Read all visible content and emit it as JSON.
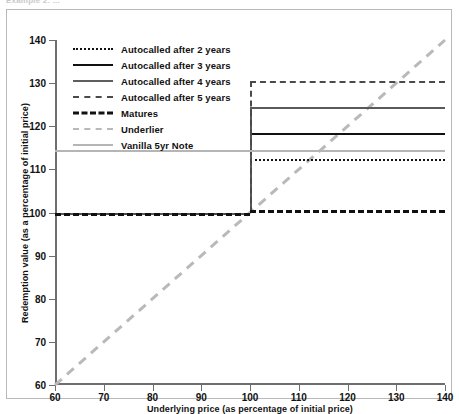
{
  "caption": "Example 2: ...",
  "chart_data": {
    "type": "line",
    "title": "",
    "xlabel": "Underlying price (as percentage of initial price)",
    "ylabel": "Redemption value (as a percentage of initial price)",
    "xlim": [
      60,
      140
    ],
    "ylim": [
      60,
      140
    ],
    "xticks": [
      60,
      70,
      80,
      90,
      100,
      110,
      120,
      130,
      140
    ],
    "yticks": [
      60,
      70,
      80,
      90,
      100,
      110,
      120,
      130,
      140
    ],
    "grid": false,
    "legend_position": "upper-left-inside",
    "step_x": 100,
    "series": [
      {
        "name": "Autocalled after 2 years",
        "style": "dotted",
        "color": "#111111",
        "x": [
          60,
          100,
          100,
          140
        ],
        "y": [
          100,
          100,
          112.5,
          112.5
        ]
      },
      {
        "name": "Autocalled after 3 years",
        "style": "solid",
        "color": "#111111",
        "x": [
          60,
          100,
          100,
          140
        ],
        "y": [
          100,
          100,
          118.5,
          118.5
        ]
      },
      {
        "name": "Autocalled after 4 years",
        "style": "solid",
        "color": "#595959",
        "x": [
          60,
          100,
          100,
          140
        ],
        "y": [
          100,
          100,
          124.5,
          124.5
        ]
      },
      {
        "name": "Autocalled after 5 years",
        "style": "dashed",
        "color": "#4a4a4a",
        "x": [
          60,
          100,
          100,
          140
        ],
        "y": [
          100,
          100,
          130.5,
          130.5
        ]
      },
      {
        "name": "Matures",
        "style": "dashed-bold",
        "color": "#111111",
        "x": [
          60,
          100,
          100,
          140
        ],
        "y": [
          100,
          100,
          100.5,
          100.5
        ]
      },
      {
        "name": "Underlier",
        "style": "dashed",
        "color": "#b9b9b9",
        "x": [
          60,
          140
        ],
        "y": [
          60,
          140
        ]
      },
      {
        "name": "Vanilla 5yr Note",
        "style": "solid",
        "color": "#b5b5b5",
        "x": [
          60,
          140
        ],
        "y": [
          114.5,
          114.5
        ]
      }
    ]
  },
  "legend": {
    "items": [
      {
        "label": "Autocalled after 2 years",
        "swatch": "lg-dotted-blk"
      },
      {
        "label": "Autocalled after 3 years",
        "swatch": "lg-solid-blk"
      },
      {
        "label": "Autocalled after 4 years",
        "swatch": "lg-solid-gry"
      },
      {
        "label": "Autocalled after 5 years",
        "swatch": "lg-dashed-gry"
      },
      {
        "label": "Matures",
        "swatch": "lg-dashed-blk"
      },
      {
        "label": "Underlier",
        "swatch": "lg-dashed-ltg"
      },
      {
        "label": "Vanilla 5yr Note",
        "swatch": "lg-solid-ltg"
      }
    ]
  }
}
